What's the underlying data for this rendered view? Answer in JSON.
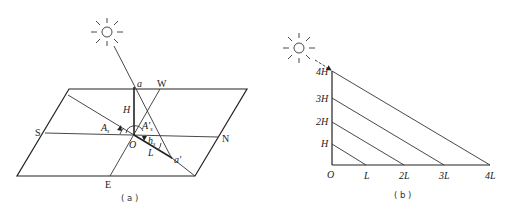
{
  "panel_a": {
    "caption": "( a )",
    "compass": {
      "south": "S",
      "north": "N",
      "west": "W",
      "east": "E"
    },
    "points": {
      "sun_top": "a",
      "origin": "O",
      "shadow_tip": "a'"
    },
    "segments": {
      "height": "H",
      "shadow_length": "L"
    },
    "angles": {
      "solar_azimuth": "A",
      "solar_azimuth_sub": "s",
      "shadow_azimuth": "A'",
      "shadow_azimuth_sub": "s",
      "solar_altitude": "h",
      "solar_altitude_sub": "s"
    },
    "icons": [
      "sun-icon"
    ]
  },
  "panel_b": {
    "caption": "( b )",
    "origin": "O",
    "height_ticks": [
      "H",
      "2H",
      "3H",
      "4H"
    ],
    "length_ticks": [
      "L",
      "2L",
      "3L",
      "4L"
    ],
    "icons": [
      "sun-icon",
      "arrow-icon"
    ]
  }
}
